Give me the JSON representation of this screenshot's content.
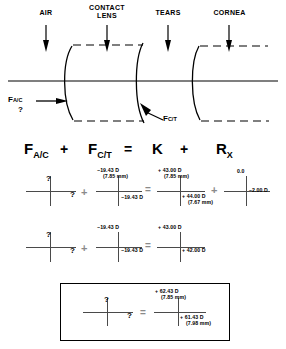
{
  "diagram": {
    "labels": [
      {
        "name": "air",
        "text": "AIR"
      },
      {
        "name": "contact-lens",
        "text": "CONTACT\nLENS"
      },
      {
        "name": "tears",
        "text": "TEARS"
      },
      {
        "name": "cornea",
        "text": "CORNEA"
      }
    ],
    "annotations": [
      {
        "name": "f-ac",
        "base": "F",
        "sub": "A/C",
        "unknown": "?"
      },
      {
        "name": "f-ct",
        "base": "F",
        "sub": "C/T"
      }
    ]
  },
  "formula": {
    "terms": [
      {
        "name": "f-ac",
        "base": "F",
        "sub": "A/C"
      },
      {
        "name": "f-ct",
        "base": "F",
        "sub": "C/T"
      },
      {
        "name": "k",
        "base": "K",
        "sub": ""
      },
      {
        "name": "rx",
        "base": "R",
        "sub": "X"
      }
    ],
    "operators": {
      "plus1": "+",
      "equals": "=",
      "plus2": "+"
    }
  },
  "rows": [
    {
      "name": "row-1",
      "unknown_cross": {
        "top": "?",
        "right": "?"
      },
      "op_plus": "+",
      "fct_cross": {
        "top": "−19.43 D",
        "top_mm": "(7.85 mm)",
        "bottom": "−19.43 D"
      },
      "op_equals": "=",
      "k_cross": {
        "top": "+ 43.00 D",
        "top_mm": "(7.85 mm)",
        "bottom": "+ 44.00 D",
        "bottom_mm": "(7.67 mm)"
      },
      "op_plus2": "+",
      "rx_cross": {
        "top": "0.0",
        "right": "–2.00 D"
      }
    },
    {
      "name": "row-2",
      "unknown_cross": {
        "top": "?",
        "right": "?"
      },
      "op_plus": "+",
      "fct_cross": {
        "top": "−19.43 D",
        "bottom": "−19.43 D"
      },
      "op_equals": "=",
      "k_cross": {
        "top": "+ 43.00 D",
        "bottom": "+ 42.00 D"
      }
    }
  ],
  "result": {
    "name": "result-box",
    "unknown_cross": {
      "top": "?",
      "right": "?"
    },
    "op_equals": "=",
    "total_cross": {
      "top": "+ 62.43 D",
      "top_mm": "(7.85 mm)",
      "bottom": "+ 61.43 D",
      "bottom_mm": "(7.98 mm)"
    }
  },
  "colors": {
    "ink": "#000000",
    "cross": "#4a4a4a",
    "faded_op": "#8a8a8a"
  }
}
